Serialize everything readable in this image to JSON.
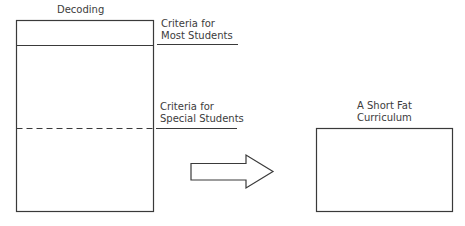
{
  "left_block": {
    "title": "Decoding",
    "criteria_most": {
      "line1": "Criteria for",
      "line2": "Most Students"
    },
    "criteria_special": {
      "line1": "Criteria for",
      "line2": "Special Students"
    }
  },
  "arrow": {
    "direction": "right",
    "icon": "right-arrow-icon"
  },
  "right_block": {
    "title_line1": "A Short Fat",
    "title_line2": "Curriculum"
  },
  "colors": {
    "stroke": "#3a3a3a",
    "text": "#3c3c3c",
    "background": "#ffffff"
  }
}
